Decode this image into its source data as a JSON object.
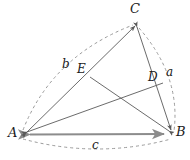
{
  "figure": {
    "kind": "geometry-diagram",
    "canvas": {
      "width": 190,
      "height": 160,
      "background": "#ffffff"
    },
    "colors": {
      "stroke": "#5a5a5a",
      "base_stroke": "#8c8c8c",
      "dashed_stroke": "#9a9a9a",
      "label": "#1a1a1a"
    },
    "vertices": [
      {
        "id": "A",
        "label": "A",
        "x": 21,
        "y": 135,
        "label_x": 8,
        "label_y": 128
      },
      {
        "id": "B",
        "label": "B",
        "x": 172,
        "y": 134,
        "label_x": 176,
        "label_y": 127
      },
      {
        "id": "C",
        "label": "C",
        "x": 136,
        "y": 24,
        "label_x": 131,
        "label_y": 3
      }
    ],
    "points": [
      {
        "id": "D",
        "label": "D",
        "x": 163,
        "y": 83,
        "label_x": 148,
        "label_y": 72,
        "on_segment": "C-B"
      },
      {
        "id": "E",
        "label": "E",
        "x": 90,
        "y": 77,
        "label_x": 77,
        "label_y": 64,
        "on_segment": "A-C"
      }
    ],
    "segments": [
      {
        "id": "AB",
        "from": "A",
        "to": "B",
        "style": "solid-base"
      },
      {
        "id": "AC",
        "from": "A",
        "to": "C",
        "style": "solid"
      },
      {
        "id": "CB",
        "from": "C",
        "to": "B",
        "style": "solid"
      },
      {
        "id": "AD",
        "from": "A",
        "to": "D",
        "style": "solid"
      },
      {
        "id": "BE",
        "from": "B",
        "to": "E",
        "style": "solid"
      }
    ],
    "arrowheads_at": [
      "A",
      "B",
      "C"
    ],
    "arcs": [
      {
        "id": "arc-a",
        "label": "a",
        "from": "C",
        "to": "B",
        "bulge": "outward-right",
        "label_x": 168,
        "label_y": 68
      },
      {
        "id": "arc-b",
        "label": "b",
        "from": "A",
        "to": "C",
        "bulge": "outward-left",
        "label_x": 63,
        "label_y": 60
      },
      {
        "id": "arc-c",
        "label": "c",
        "from": "A",
        "to": "B",
        "bulge": "outward-down",
        "label_x": 94,
        "label_y": 141
      }
    ],
    "cevian_intersection": {
      "x": 115,
      "y": 93
    }
  }
}
